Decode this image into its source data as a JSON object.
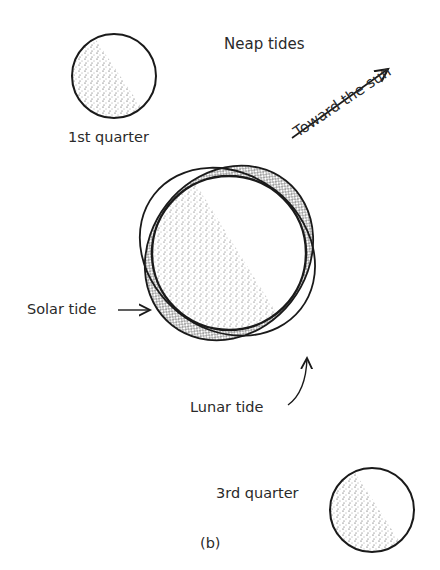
{
  "figure": {
    "title": "Neap tides",
    "panel_label": "(b)",
    "sun_direction_label": "Toward the sun",
    "moons": [
      {
        "label": "1st quarter"
      },
      {
        "label": "3rd quarter"
      }
    ],
    "tides": {
      "solar": "Solar tide",
      "lunar": "Lunar tide"
    },
    "colors": {
      "ink": "#1a1a1a",
      "background": "#ffffff"
    }
  }
}
